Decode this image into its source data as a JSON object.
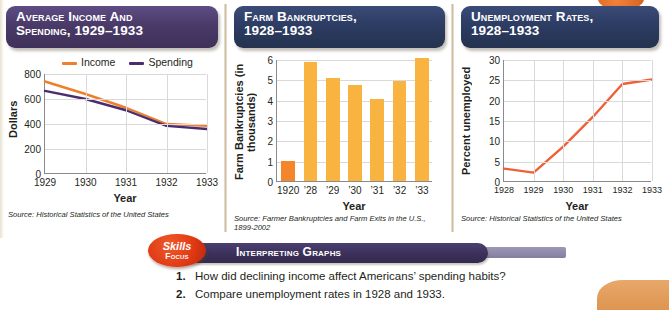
{
  "panels": [
    {
      "title_line1": "Average Income and",
      "title_line2": "Spending, 1929–1933",
      "source": "Source: Historical Statistics of the United States",
      "xlabel": "Year",
      "ylabel": "Dollars",
      "legend": [
        {
          "label": "Income",
          "color": "#f07f2d"
        },
        {
          "label": "Spending",
          "color": "#4b2d6f"
        }
      ]
    },
    {
      "title_line1": "Farm Bankruptcies,",
      "title_line2": "1928–1933",
      "source_line1": "Source: Farmer Bankruptcies and Farm Exits in the U.S.,",
      "source_line2": "1899-2002",
      "xlabel": "Year",
      "ylabel_line1": "Farm Bankruptcies",
      "ylabel_line2": "(in thousands)"
    },
    {
      "title_line1": "Unemployment Rates,",
      "title_line2": "1928–1933",
      "source": "Source: Historical Statistics of the United States",
      "xlabel": "Year",
      "ylabel": "Percent unemployed"
    }
  ],
  "skills": {
    "badge_line1": "Skills",
    "badge_line2": "Focus",
    "banner_label": "Interpreting Graphs"
  },
  "questions": [
    {
      "num": "1.",
      "text": "How did declining income affect Americans’ spending habits?"
    },
    {
      "num": "2.",
      "text": "Compare unemployment rates in 1928 and 1933."
    }
  ],
  "chart_data": [
    {
      "type": "line",
      "title": "Average Income and Spending, 1929–1933",
      "xlabel": "Year",
      "ylabel": "Dollars",
      "x": [
        "1929",
        "1930",
        "1931",
        "1932",
        "1933"
      ],
      "ylim": [
        0,
        800
      ],
      "yticks": [
        0,
        200,
        400,
        600,
        800
      ],
      "grid": true,
      "legend_position": "top",
      "series": [
        {
          "name": "Income",
          "color": "#f07f2d",
          "values": [
            740,
            640,
            530,
            400,
            385
          ]
        },
        {
          "name": "Spending",
          "color": "#4b2d6f",
          "values": [
            665,
            600,
            510,
            385,
            360
          ]
        }
      ]
    },
    {
      "type": "bar",
      "title": "Farm Bankruptcies, 1928–1933",
      "xlabel": "Year",
      "ylabel": "Farm Bankruptcies (in thousands)",
      "categories": [
        "1920",
        "’28",
        "’29",
        "’30",
        "’31",
        "’32",
        "’33"
      ],
      "values": [
        1.0,
        5.85,
        5.05,
        4.7,
        4.05,
        4.9,
        6.05
      ],
      "colors": [
        "#f4852a",
        "#f9b340",
        "#f9b340",
        "#f9b340",
        "#f9b340",
        "#f9b340",
        "#f9b340"
      ],
      "ylim": [
        0,
        6
      ],
      "yticks": [
        0,
        1,
        2,
        3,
        4,
        5,
        6
      ],
      "grid": true
    },
    {
      "type": "line",
      "title": "Unemployment Rates, 1928–1933",
      "xlabel": "Year",
      "ylabel": "Percent unemployed",
      "x": [
        "1928",
        "1929",
        "1930",
        "1931",
        "1932",
        "1933"
      ],
      "ylim": [
        0,
        30
      ],
      "yticks": [
        0,
        5,
        10,
        15,
        20,
        25,
        30
      ],
      "grid": true,
      "series": [
        {
          "name": "Percent unemployed",
          "color": "#ef6036",
          "values": [
            3.3,
            2.3,
            8.7,
            16.0,
            24.1,
            25.2
          ]
        }
      ]
    }
  ]
}
